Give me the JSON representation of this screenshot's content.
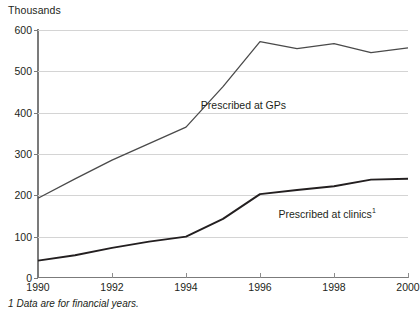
{
  "chart_data": {
    "type": "line",
    "title": "",
    "ylabel": "Thousands",
    "xlabel": "",
    "ylim": [
      0,
      600
    ],
    "xlim": [
      1990,
      2000
    ],
    "yticks": [
      0,
      100,
      200,
      300,
      400,
      500,
      600
    ],
    "ytick_labels": [
      "0",
      "100",
      "200",
      "300",
      "400",
      "500",
      "600"
    ],
    "xticks": [
      1990,
      1992,
      1994,
      1996,
      1998,
      2000
    ],
    "xtick_labels": [
      "1990",
      "1992",
      "1994",
      "1996",
      "1998",
      "2000"
    ],
    "grid": true,
    "legend_position": "inline-annotations",
    "x": [
      1990,
      1991,
      1992,
      1993,
      1994,
      1995,
      1996,
      1997,
      1998,
      1999,
      2000
    ],
    "series": [
      {
        "name": "Prescribed at GPs",
        "label": "Prescribed at GPs",
        "color": "#4a4a4a",
        "values": [
          193,
          240,
          285,
          325,
          365,
          463,
          572,
          555,
          567,
          545,
          557
        ]
      },
      {
        "name": "Prescribed at clinics",
        "label": "Prescribed at clinics",
        "label_footnote_marker": "1",
        "color": "#231f20",
        "values": [
          42,
          55,
          73,
          88,
          100,
          143,
          203,
          213,
          222,
          238,
          240
        ]
      }
    ],
    "annotations": [
      {
        "text": "Prescribed at GPs",
        "x": 1994.4,
        "y": 415
      },
      {
        "text": "Prescribed at clinics",
        "footnote_marker": "1",
        "x": 1996.5,
        "y": 155
      }
    ],
    "footnote": {
      "marker": "1",
      "text": "Data are for financial years."
    },
    "colors": {
      "gridline": "#d4d4d4",
      "axis": "#7b7b7b",
      "text": "#231f20"
    }
  }
}
